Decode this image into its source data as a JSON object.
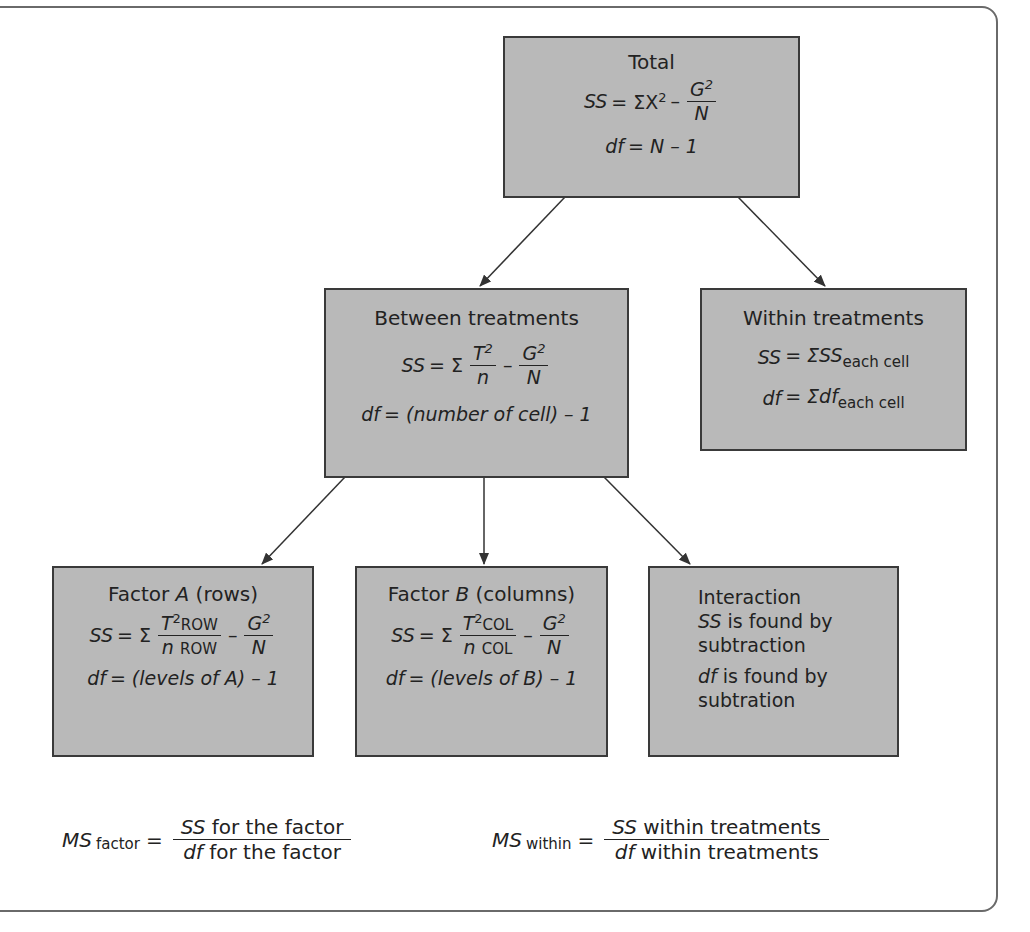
{
  "nodes": {
    "total": {
      "title": "Total",
      "ss_label": "SS",
      "ss_eq": "= ΣX",
      "ss_exp": "2",
      "minus": "–",
      "g_num": "G",
      "g_exp": "2",
      "n_den": "N",
      "df_label": "df",
      "df_eq": "= N – 1"
    },
    "between": {
      "title": "Between treatments",
      "ss_label": "SS",
      "ss_eq": "= Σ",
      "t_num": "T",
      "t_exp": "2",
      "n_den": "n",
      "minus": "–",
      "g_num": "G",
      "g_exp": "2",
      "N_den": "N",
      "df_label": "df",
      "df_eq": "= (number of cell) – 1"
    },
    "within": {
      "title": "Within treatments",
      "ss_label": "SS",
      "ss_eq": "= ΣSS",
      "ss_sub": "each cell",
      "df_label": "df",
      "df_eq": "= Σdf",
      "df_sub": "each cell"
    },
    "factor_a": {
      "title_pre": "Factor",
      "title_var": "A",
      "title_post": "(rows)",
      "ss_label": "SS",
      "ss_eq": "= Σ",
      "t_num": "T",
      "t_exp": "2",
      "t_sub": "ROW",
      "n_den": "n",
      "n_sub": "ROW",
      "minus": "–",
      "g_num": "G",
      "g_exp": "2",
      "N_den": "N",
      "df_label": "df",
      "df_eq": "= (levels of A) – 1"
    },
    "factor_b": {
      "title_pre": "Factor",
      "title_var": "B",
      "title_post": "(columns)",
      "ss_label": "SS",
      "ss_eq": "= Σ",
      "t_num": "T",
      "t_exp": "2",
      "t_sub": "COL",
      "n_den": "n",
      "n_sub": "COL",
      "minus": "–",
      "g_num": "G",
      "g_exp": "2",
      "N_den": "N",
      "df_label": "df",
      "df_eq": "= (levels of B) – 1"
    },
    "interaction": {
      "title": "Interaction",
      "ss_label": "SS",
      "ss_text": " is found by",
      "ss_text2": "subtraction",
      "df_label": "df",
      "df_text": " is found by",
      "df_text2": "subtration"
    }
  },
  "edges": [
    {
      "from": "total",
      "to": "between"
    },
    {
      "from": "total",
      "to": "within"
    },
    {
      "from": "between",
      "to": "factor_a"
    },
    {
      "from": "between",
      "to": "factor_b"
    },
    {
      "from": "between",
      "to": "interaction"
    }
  ],
  "ms_formulas": {
    "factor": {
      "ms": "MS",
      "sub": "factor",
      "eq": "=",
      "num_var": "SS",
      "num_text": "for the factor",
      "den_var": "df",
      "den_text": "for the factor"
    },
    "within": {
      "ms": "MS",
      "sub": "within",
      "eq": "=",
      "num_var": "SS",
      "num_text": "within treatments",
      "den_var": "df",
      "den_text": "within treatments"
    }
  },
  "colors": {
    "box_fill": "#b9b9b9",
    "box_border": "#3a3a3a",
    "frame": "#6a6a6a",
    "arrow": "#333333"
  }
}
